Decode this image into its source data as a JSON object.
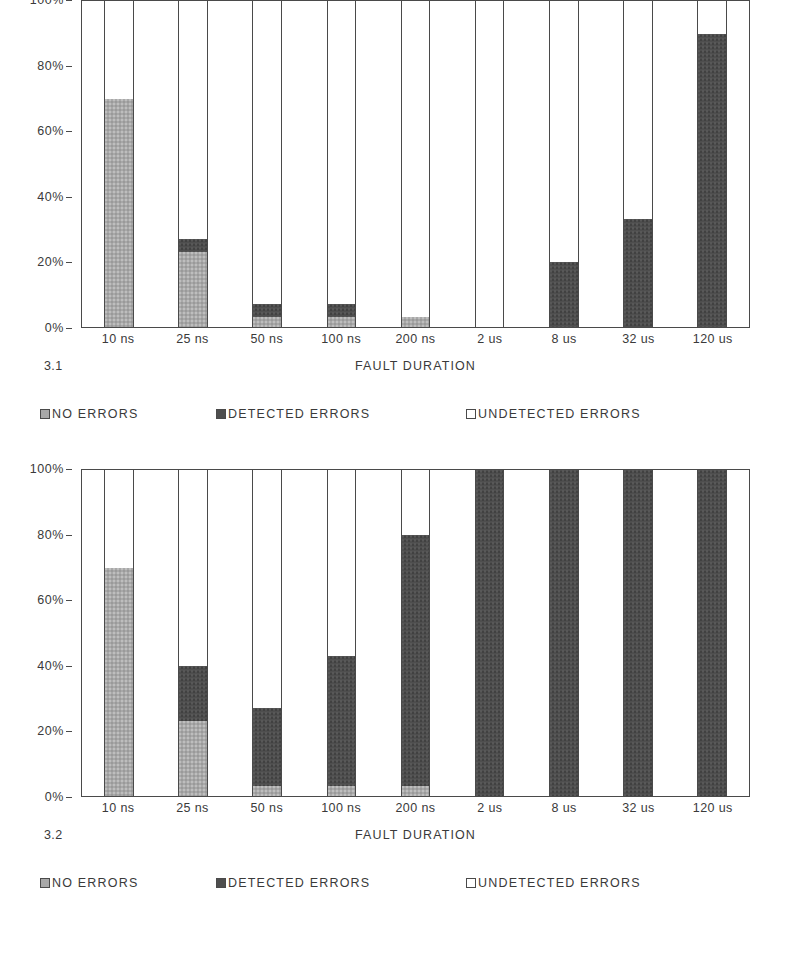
{
  "legend": {
    "items": [
      {
        "label": "NO ERRORS",
        "key": "none",
        "color": "#a8a8a8",
        "icon": "legend-swatch-no-errors"
      },
      {
        "label": "DETECTED ERRORS",
        "key": "detected",
        "color": "#4e4e4e",
        "icon": "legend-swatch-detected-errors"
      },
      {
        "label": "UNDETECTED ERRORS",
        "key": "undetected",
        "color": "#ffffff",
        "icon": "legend-swatch-undetected-errors"
      }
    ]
  },
  "figures": [
    {
      "number": "3.1",
      "xlabel": "FAULT DURATION",
      "yticks": [
        "0%",
        "20%",
        "40%",
        "60%",
        "80%",
        "100%"
      ]
    },
    {
      "number": "3.2",
      "xlabel": "FAULT DURATION",
      "yticks": [
        "0%",
        "20%",
        "40%",
        "60%",
        "80%",
        "100%"
      ]
    }
  ],
  "chart_data": [
    {
      "type": "bar",
      "stacked": true,
      "title": "3.1",
      "xlabel": "FAULT DURATION",
      "ylabel": "",
      "ylim": [
        0,
        100
      ],
      "ytick_values": [
        0,
        20,
        40,
        60,
        80,
        100
      ],
      "ytick_labels": [
        "0%",
        "20%",
        "40%",
        "60%",
        "80%",
        "100%"
      ],
      "grid": false,
      "legend_position": "below",
      "categories": [
        "10 ns",
        "25 ns",
        "50 ns",
        "100 ns",
        "200 ns",
        "2 us",
        "8 us",
        "32 us",
        "120 us"
      ],
      "series": [
        {
          "name": "NO ERRORS",
          "color": "#a8a8a8",
          "values": [
            70,
            23,
            3,
            3,
            3,
            0,
            0,
            0,
            0
          ]
        },
        {
          "name": "DETECTED ERRORS",
          "color": "#4e4e4e",
          "values": [
            0,
            4,
            4,
            4,
            0,
            0,
            20,
            33,
            90
          ]
        },
        {
          "name": "UNDETECTED ERRORS",
          "color": "#ffffff",
          "values": [
            30,
            73,
            93,
            93,
            97,
            100,
            80,
            67,
            10
          ]
        }
      ]
    },
    {
      "type": "bar",
      "stacked": true,
      "title": "3.2",
      "xlabel": "FAULT DURATION",
      "ylabel": "",
      "ylim": [
        0,
        100
      ],
      "ytick_values": [
        0,
        20,
        40,
        60,
        80,
        100
      ],
      "ytick_labels": [
        "0%",
        "20%",
        "40%",
        "60%",
        "80%",
        "100%"
      ],
      "grid": false,
      "legend_position": "below",
      "categories": [
        "10 ns",
        "25 ns",
        "50 ns",
        "100 ns",
        "200 ns",
        "2 us",
        "8 us",
        "32 us",
        "120 us"
      ],
      "series": [
        {
          "name": "NO ERRORS",
          "color": "#a8a8a8",
          "values": [
            70,
            23,
            3,
            3,
            3,
            0,
            0,
            0,
            0
          ]
        },
        {
          "name": "DETECTED ERRORS",
          "color": "#4e4e4e",
          "values": [
            0,
            17,
            24,
            40,
            77,
            100,
            100,
            100,
            100
          ]
        },
        {
          "name": "UNDETECTED ERRORS",
          "color": "#ffffff",
          "values": [
            30,
            60,
            73,
            57,
            20,
            0,
            0,
            0,
            0
          ]
        }
      ]
    }
  ]
}
